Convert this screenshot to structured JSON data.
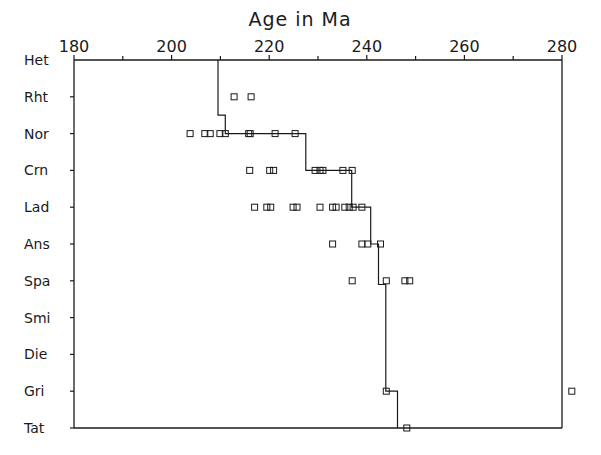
{
  "chart_data": {
    "type": "scatter",
    "title": "Age in Ma",
    "xlabel": "Age in Ma",
    "ylabel": "",
    "xlim": [
      180,
      280
    ],
    "x_ticks_major": [
      180,
      200,
      220,
      240,
      260,
      280
    ],
    "x_ticks_minor": [
      190,
      210,
      230,
      250,
      270
    ],
    "axis_position": "top",
    "grid": false,
    "legend": null,
    "categories": [
      "Het",
      "Rht",
      "Nor",
      "Crn",
      "Lad",
      "Ans",
      "Spa",
      "Smi",
      "Die",
      "Gri",
      "Tat"
    ],
    "points": [
      {
        "stage": "Rht",
        "ages": [
          212.8,
          216.3
        ]
      },
      {
        "stage": "Nor",
        "ages": [
          203.8,
          206.8,
          207.9,
          209.9,
          211.0,
          215.8,
          216.1,
          221.2,
          225.3
        ]
      },
      {
        "stage": "Crn",
        "ages": [
          216.0,
          220.1,
          220.9,
          229.4,
          230.4,
          231.0,
          235.1,
          237.0
        ]
      },
      {
        "stage": "Lad",
        "ages": [
          217.0,
          219.5,
          220.3,
          224.9,
          225.7,
          230.4,
          233.0,
          233.7,
          235.5,
          236.4,
          237.2,
          239.0
        ]
      },
      {
        "stage": "Ans",
        "ages": [
          233.0,
          239.0,
          240.2,
          242.8
        ]
      },
      {
        "stage": "Spa",
        "ages": [
          237.0,
          244.0,
          247.8,
          248.8
        ]
      },
      {
        "stage": "Smi",
        "ages": []
      },
      {
        "stage": "Die",
        "ages": []
      },
      {
        "stage": "Gri",
        "ages": [
          244.0,
          282.0
        ]
      },
      {
        "stage": "Tat",
        "ages": [
          248.2
        ]
      }
    ],
    "step_line": {
      "description": "Stage boundary age estimate (step function)",
      "vertices": [
        {
          "age": 209.5,
          "stage": "Het"
        },
        {
          "age": 209.5,
          "stage_pos": 1.5
        },
        {
          "age": 211.0,
          "stage_pos": 1.5
        },
        {
          "age": 211.0,
          "stage": "Nor"
        },
        {
          "age": 227.5,
          "stage": "Nor"
        },
        {
          "age": 227.5,
          "stage": "Crn"
        },
        {
          "age": 236.9,
          "stage": "Crn"
        },
        {
          "age": 236.9,
          "stage": "Lad"
        },
        {
          "age": 240.8,
          "stage": "Lad"
        },
        {
          "age": 240.8,
          "stage": "Ans"
        },
        {
          "age": 242.4,
          "stage": "Ans"
        },
        {
          "age": 242.4,
          "stage_pos": 6.1
        },
        {
          "age": 243.9,
          "stage_pos": 6.1
        },
        {
          "age": 243.9,
          "stage": "Gri"
        },
        {
          "age": 246.3,
          "stage": "Gri"
        },
        {
          "age": 246.3,
          "stage": "Tat"
        }
      ]
    }
  },
  "layout": {
    "plot_left_px": 74,
    "plot_right_px": 562,
    "plot_top_px": 60,
    "plot_bottom_px": 428,
    "title_x_px": 300,
    "title_y_px": 25,
    "stroke_color": "#1a1a1a",
    "point_size_px": 6
  }
}
